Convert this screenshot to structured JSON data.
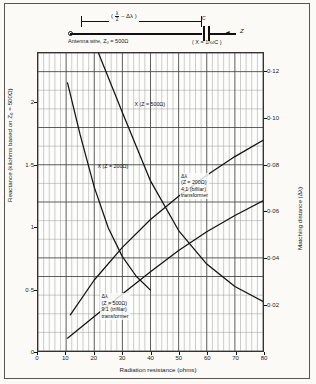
{
  "schematic": {
    "dimension_label": "( λ/2 − Δλ )",
    "dim_num": "λ",
    "dim_den": "2",
    "dim_prefix": "(",
    "dim_suffix": "− Δλ )",
    "antenna_label": "Antenna wire, Z₀ = 500Ω",
    "capacitor_label": "C",
    "capacitor_formula": "( X = 1/ωC )",
    "impedance_label": "Z",
    "arrow_glyph": "◄"
  },
  "chart_data": {
    "type": "line",
    "title": "",
    "xlabel": "Radiation resistance (ohms)",
    "ylabel": "Reactance (kilohms based on Z₀ = 500Ω)",
    "ylabel_right": "Matching distance (Δλ)",
    "xlim": [
      0,
      80
    ],
    "ylim": [
      0,
      2.4
    ],
    "ylim_right": [
      0,
      0.128
    ],
    "grid": true,
    "legend_position": "inline-annotations",
    "xticks": [
      0,
      10,
      20,
      30,
      40,
      50,
      60,
      70,
      80
    ],
    "xtick_labels": [
      "0",
      "10",
      "20",
      "30",
      "40",
      "50",
      "60",
      "70",
      "80"
    ],
    "yticks_left": [
      0,
      0.5,
      1,
      1.5,
      2
    ],
    "ytick_labels_left": [
      "0",
      "0·5",
      "1",
      "1·5",
      "2"
    ],
    "yticks_right": [
      0.02,
      0.04,
      0.06,
      0.08,
      0.1,
      0.12
    ],
    "ytick_labels_right": [
      "0·02",
      "0·04",
      "0·06",
      "0·08",
      "0·10",
      "0·12"
    ],
    "series": [
      {
        "name": "X (Z = 500Ω)",
        "axis": "left",
        "annotation": "X (Z = 500Ω)",
        "annotation_x": 34,
        "annotation_y": 2.02,
        "points": [
          [
            21.5,
            2.4
          ],
          [
            30,
            1.92
          ],
          [
            40,
            1.37
          ],
          [
            50,
            0.97
          ],
          [
            60,
            0.7
          ],
          [
            70,
            0.52
          ],
          [
            80,
            0.4
          ]
        ]
      },
      {
        "name": "X (Z = 200Ω)",
        "axis": "left",
        "annotation": "X (Z = 200Ω)",
        "annotation_x": 21,
        "annotation_y": 1.52,
        "points": [
          [
            10.5,
            2.16
          ],
          [
            15,
            1.74
          ],
          [
            20,
            1.32
          ],
          [
            25,
            0.99
          ],
          [
            30,
            0.76
          ],
          [
            35,
            0.6
          ],
          [
            40,
            0.49
          ]
        ]
      },
      {
        "name": "Δλ (Z = 200Ω) 4:1 (bifilar) transformer",
        "axis": "right",
        "annotation": "Δλ\n(Z = 200Ω)\n4:1 (bifilar)\ntransformer",
        "annotation_x": 50,
        "annotation_y": 0.077,
        "points": [
          [
            11.5,
            0.0155
          ],
          [
            20,
            0.0305
          ],
          [
            30,
            0.0445
          ],
          [
            40,
            0.0565
          ],
          [
            50,
            0.0665
          ],
          [
            60,
            0.0755
          ],
          [
            70,
            0.0835
          ],
          [
            80,
            0.0905
          ]
        ]
      },
      {
        "name": "Δλ (Z = 500Ω) 9:1 (trifilar) transformer",
        "axis": "right",
        "annotation": "Δλ\n(Z = 500Ω)\n9:1 (trifilar)\ntransformer",
        "annotation_x": 22,
        "annotation_y": 0.0255,
        "points": [
          [
            10.5,
            0.0055
          ],
          [
            20,
            0.0148
          ],
          [
            30,
            0.0245
          ],
          [
            40,
            0.034
          ],
          [
            50,
            0.0432
          ],
          [
            60,
            0.0512
          ],
          [
            70,
            0.0582
          ],
          [
            80,
            0.0645
          ]
        ]
      }
    ],
    "annotations": [
      {
        "name": "x-500-label",
        "text": "X (Z = 500Ω)"
      },
      {
        "name": "x-200-label",
        "text": "X (Z = 200Ω)"
      },
      {
        "name": "dl-200-label",
        "lines": [
          "Δλ",
          "(Z = 200Ω)",
          "4:1 (bifilar)",
          "transformer"
        ]
      },
      {
        "name": "dl-500-label",
        "lines": [
          "Δλ",
          "(Z = 500Ω)",
          "9:1 (trifilar)",
          "transformer"
        ]
      }
    ]
  },
  "colors": {
    "curve": "#111111",
    "grid_minor": "#9a9a9a",
    "grid_major": "#444444",
    "background": "#fbfaf7",
    "frame": "#555555"
  }
}
